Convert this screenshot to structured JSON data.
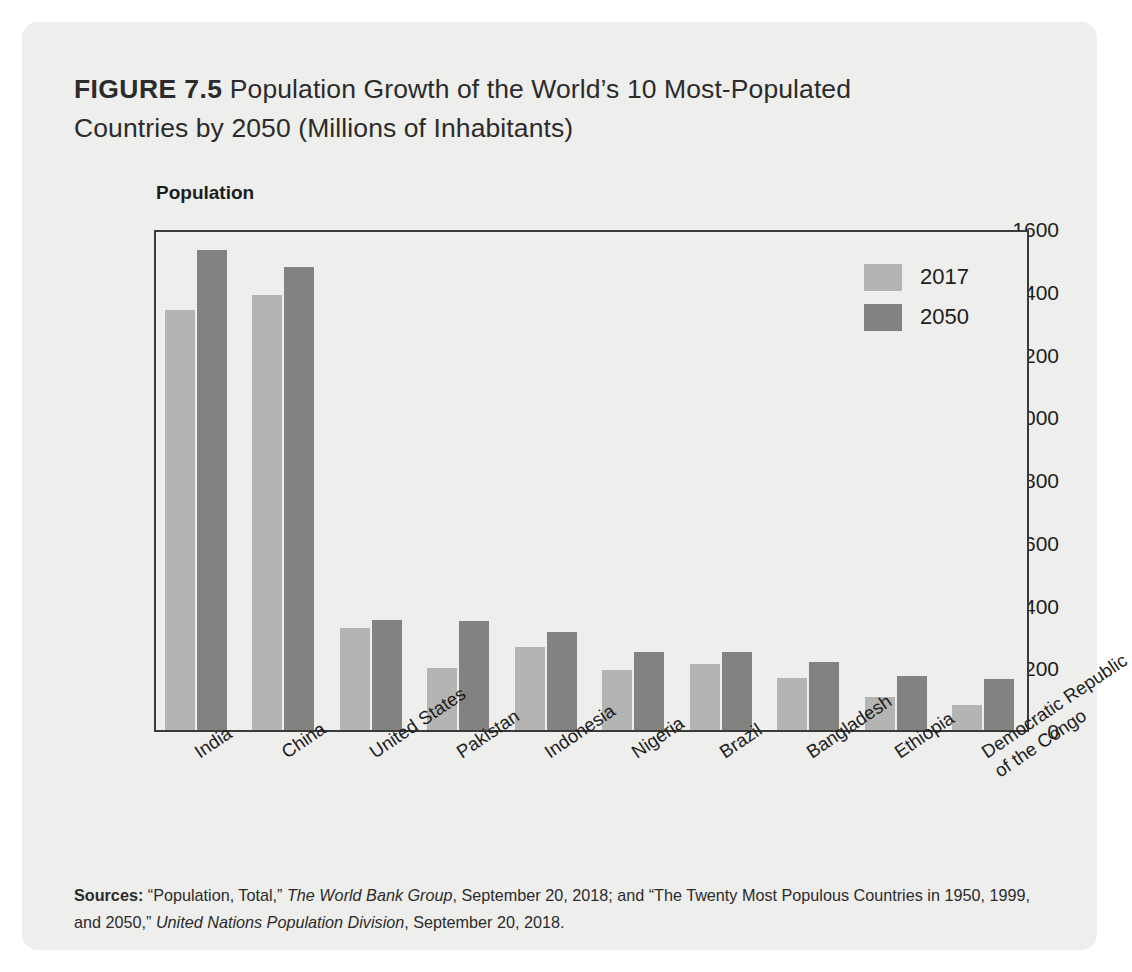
{
  "figure": {
    "label": "FIGURE 7.5",
    "title_line1": " Population Growth of the World’s 10 Most-Populated",
    "title_line2": "Countries by 2050 (Millions of Inhabitants)"
  },
  "source": {
    "label": "Sources:",
    "part1": " “Population, Total,” ",
    "italic1": "The World Bank Group",
    "part2": ", September 20, 2018; and “The Twenty Most Populous Countries in 1950, 1999, and 2050,” ",
    "italic2": "United Nations Population Division",
    "part3": ", September 20, 2018."
  },
  "legend": {
    "items": [
      {
        "label": "2017",
        "color": "#b4b4b2"
      },
      {
        "label": "2050",
        "color": "#828280"
      }
    ]
  },
  "chart_data": {
    "type": "bar",
    "title": "FIGURE 7.5 Population Growth of the World’s 10 Most-Populated Countries by 2050 (Millions of Inhabitants)",
    "xlabel": "",
    "ylabel": "Population",
    "ylim": [
      0,
      1600
    ],
    "yticks": [
      0,
      200,
      400,
      600,
      800,
      1000,
      1200,
      1400,
      1600
    ],
    "ytick_labels": [
      "0",
      "200",
      "400",
      "600",
      "800",
      "1000",
      "1200",
      "1400",
      "1600"
    ],
    "grid": false,
    "legend_position": "top-right",
    "categories": [
      "India",
      "China",
      "United States",
      "Pakistan",
      "Indonesia",
      "Nigeria",
      "Brazil",
      "Bangladesh",
      "Ethiopia",
      "Democratic Republic\nof the Congo"
    ],
    "series": [
      {
        "name": "2017",
        "color": "#b4b4b2",
        "values": [
          1339,
          1386,
          326,
          197,
          264,
          191,
          209,
          165,
          105,
          81
        ]
      },
      {
        "name": "2050",
        "color": "#828280",
        "values": [
          1531,
          1477,
          350,
          348,
          312,
          248,
          248,
          216,
          172,
          164
        ]
      }
    ]
  }
}
